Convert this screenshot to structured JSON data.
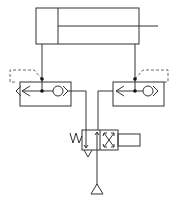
{
  "diagram": {
    "type": "pneumatic-circuit",
    "components": [
      {
        "id": "cylinder",
        "label": "double-acting cylinder"
      },
      {
        "id": "left-valve",
        "label": "pilot-operated check valve (left)"
      },
      {
        "id": "right-valve",
        "label": "pilot-operated check valve (right)"
      },
      {
        "id": "directional-valve",
        "label": "4/2 solenoid directional valve with spring return"
      },
      {
        "id": "pressure-source",
        "label": "pressure supply"
      }
    ],
    "colors": {
      "line": "#333333",
      "background": "#ffffff"
    }
  }
}
